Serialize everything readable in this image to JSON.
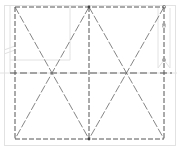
{
  "drawing": {
    "title": "Dashed frame with triangular bracing",
    "colors": {
      "background": "#ffffff",
      "frame_line": "#555555",
      "brace_line": "#666666",
      "faint_line": "#dedede",
      "node": "#444444"
    },
    "frame": {
      "x1": 15,
      "y1": 7,
      "x2": 164,
      "y2": 139
    },
    "center_x": 89,
    "mid_line_y": 73,
    "mid_line_extent": [
      10,
      172
    ],
    "nodes": [
      {
        "x": 89,
        "y": 7
      },
      {
        "x": 164,
        "y": 7
      },
      {
        "x": 89,
        "y": 139
      }
    ]
  }
}
